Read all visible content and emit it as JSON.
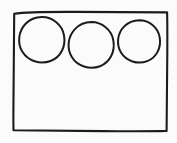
{
  "canvas": {
    "width": 177,
    "height": 143,
    "background_color": "#fbfbfb",
    "ink_color": "#1c1c1c",
    "fill_color": "#ffffff",
    "style": "hand-drawn-sketch",
    "title": "Hand-drawn rectangle containing three circles"
  },
  "diagram": {
    "type": "sketch",
    "shape_count": 4,
    "shapes": [
      {
        "id": "frame",
        "name": "rectangle",
        "role": "container",
        "x": 13,
        "y": 12,
        "width": 154,
        "height": 119,
        "stroke_width": 2.1,
        "fill": "#ffffff"
      },
      {
        "id": "circle-1",
        "name": "circle",
        "role": "child",
        "cx": 41.5,
        "cy": 39.5,
        "rx": 22.5,
        "ry": 22.5,
        "stroke_width": 2.0,
        "fill": "#ffffff"
      },
      {
        "id": "circle-2",
        "name": "circle",
        "role": "child",
        "cx": 91,
        "cy": 44.5,
        "rx": 22.5,
        "ry": 22.5,
        "stroke_width": 2.0,
        "fill": "#ffffff"
      },
      {
        "id": "circle-3",
        "name": "circle",
        "role": "child",
        "cx": 139,
        "cy": 41,
        "rx": 21,
        "ry": 21,
        "stroke_width": 2.0,
        "fill": "#ffffff"
      }
    ],
    "paths": {
      "frame": "M14.2,13.8 C14.0,40.0 13.6,74.0 13.4,110.0 C13.3,119.0 13.4,125.0 13.5,130.2 C40.0,130.6 80.0,131.0 118.0,131.2 C140.0,131.3 156.0,131.2 166.6,130.9 C166.9,112.0 167.2,82.0 167.3,52.0 C167.4,32.0 167.3,19.5 167.1,12.4 C144.0,12.2 110.0,12.0 74.0,11.9 C48.0,11.8 26.0,11.9 14.2,13.8 Z",
      "circle_1": "M41.8,17.1 C52.6,17.0 62.2,24.8 64.0,35.3 C66.0,46.6 60.6,57.3 50.6,61.0 C40.2,64.8 28.0,61.0 22.4,51.8 C17.0,43.0 18.4,31.2 25.6,23.8 C29.9,19.4 35.6,17.2 41.8,17.1 Z",
      "circle_2": "M91.4,22.1 C102.0,22.2 111.4,29.8 113.3,40.2 C115.4,51.6 110.0,62.4 100.0,66.2 C89.6,70.1 77.4,66.2 71.8,57.0 C66.4,48.1 67.9,36.3 75.2,28.9 C79.5,24.5 85.2,22.2 91.4,22.1 Z",
      "circle_3": "M139.3,20.2 C149.2,20.2 157.8,27.2 159.6,36.9 C161.6,47.5 156.6,57.5 147.3,61.1 C137.6,64.8 126.2,61.2 121.0,52.6 C116.0,44.3 117.4,33.3 124.2,26.4 C128.2,22.3 133.6,20.3 139.3,20.2 Z"
    }
  }
}
